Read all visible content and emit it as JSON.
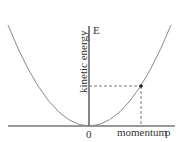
{
  "diagram": {
    "title": "",
    "y_axis_symbol": "E",
    "y_axis_label": "kinetic energy",
    "x_axis_label": "momentum",
    "x_axis_symbol": "p",
    "origin_label": "0",
    "curve": "parabola E ∝ p²",
    "highlighted_point": {
      "description": "point on curve with dashed projections to both axes"
    },
    "colors": {
      "axes": "#333333",
      "curve": "#888888",
      "dashed": "#555555",
      "point": "#222222"
    }
  }
}
